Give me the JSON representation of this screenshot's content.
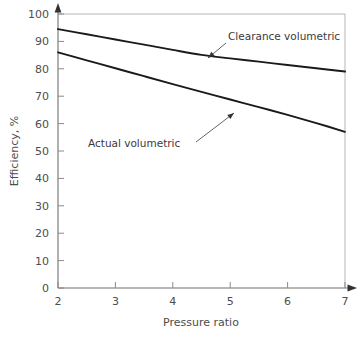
{
  "chart_data": {
    "type": "line",
    "title": "",
    "xlabel": "Pressure ratio",
    "ylabel": "Efficiency, %",
    "xlim": [
      2,
      7
    ],
    "ylim": [
      0,
      100
    ],
    "grid": false,
    "legend": "inline-annotations",
    "xticks": [
      "2",
      "3",
      "4",
      "5",
      "6",
      "7"
    ],
    "xtick_values": [
      2,
      3,
      4,
      5,
      6,
      7
    ],
    "yticks": [
      "0",
      "10",
      "20",
      "30",
      "40",
      "50",
      "60",
      "70",
      "80",
      "90",
      "100"
    ],
    "ytick_values": [
      0,
      10,
      20,
      30,
      40,
      50,
      60,
      70,
      80,
      90,
      100
    ],
    "x": [
      2,
      2.5,
      3,
      3.5,
      4,
      4.5,
      5,
      5.5,
      6,
      6.5,
      7
    ],
    "series": [
      {
        "name": "Clearance volumetric",
        "values": [
          94.5,
          92.6,
          90.7,
          88.8,
          86.9,
          85.1,
          83.8,
          82.6,
          81.4,
          80.2,
          79.0
        ],
        "color": "#1a1a1a"
      },
      {
        "name": "Actual volumetric",
        "values": [
          86.0,
          83.1,
          80.2,
          77.3,
          74.4,
          71.6,
          68.8,
          66.0,
          63.2,
          60.2,
          57.0
        ],
        "color": "#1a1a1a"
      }
    ],
    "annotations": [
      {
        "text": "Clearance volumetric",
        "label_x": 228,
        "label_y": 40,
        "leader_from_x": 226,
        "leader_from_y": 43,
        "leader_to_x": 208,
        "leader_to_y": 58
      },
      {
        "text": "Actual volumetric",
        "label_x": 88,
        "label_y": 147,
        "leader_from_x": 196,
        "leader_from_y": 142,
        "leader_to_x": 234,
        "leader_to_y": 113
      }
    ]
  },
  "axes": {
    "y_arrow_label": "y-axis-arrow",
    "x_arrow_label": "x-axis-arrow"
  }
}
